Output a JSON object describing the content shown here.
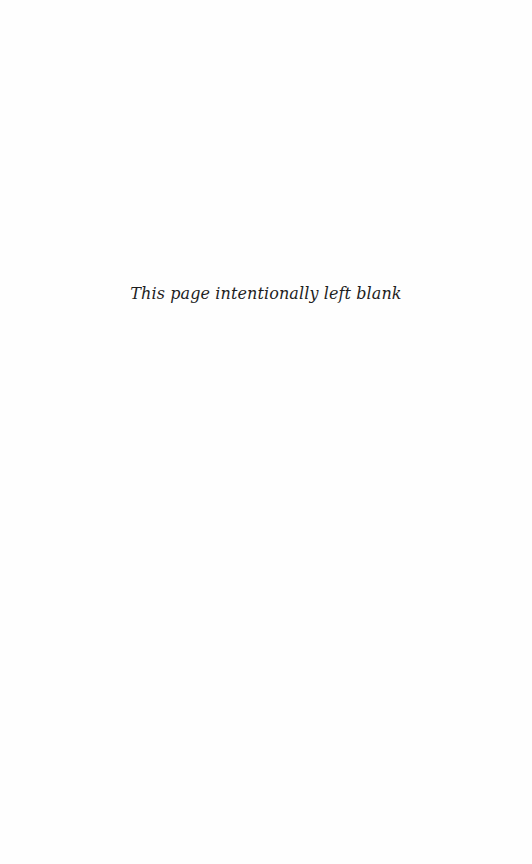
{
  "page": {
    "notice": "This page intentionally left blank"
  }
}
